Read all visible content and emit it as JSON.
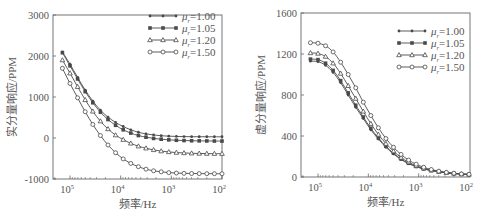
{
  "chart_data": [
    {
      "type": "line",
      "title": "",
      "xlabel": "频率/Hz",
      "ylabel": "实分量响应/PPM",
      "x_scale": "log",
      "x_reversed": true,
      "xlim_log10": [
        5.15,
        2.0
      ],
      "ylim": [
        -1000,
        3000
      ],
      "yticks": [
        -1000,
        0,
        1000,
        2000,
        3000
      ],
      "xtick_labels": [
        {
          "log10": 5,
          "base": "10",
          "exp": "5"
        },
        {
          "log10": 4,
          "base": "10",
          "exp": "4"
        },
        {
          "log10": 3,
          "base": "10",
          "exp": "3"
        },
        {
          "log10": 2,
          "base": "10",
          "exp": "2"
        }
      ],
      "grid": false,
      "legend_position": "upper right",
      "x_log10": [
        5.15,
        5.0,
        4.85,
        4.7,
        4.55,
        4.4,
        4.25,
        4.1,
        3.95,
        3.8,
        3.65,
        3.5,
        3.35,
        3.2,
        3.05,
        2.9,
        2.75,
        2.6,
        2.45,
        2.3,
        2.15,
        2.0
      ],
      "series": [
        {
          "name": "μr=1.00",
          "label_mu": "μ",
          "label_sub": "r",
          "label_val": "=1.00",
          "marker": "dot",
          "values": [
            2100,
            1800,
            1480,
            1170,
            900,
            680,
            510,
            380,
            280,
            200,
            140,
            100,
            75,
            55,
            45,
            38,
            34,
            32,
            31,
            30,
            30,
            30
          ]
        },
        {
          "name": "μr=1.05",
          "label_mu": "μ",
          "label_sub": "r",
          "label_val": "=1.05",
          "marker": "square",
          "values": [
            2080,
            1760,
            1440,
            1130,
            860,
            630,
            450,
            310,
            200,
            120,
            60,
            20,
            -10,
            -30,
            -45,
            -55,
            -62,
            -67,
            -70,
            -72,
            -74,
            -75
          ]
        },
        {
          "name": "μr=1.20",
          "label_mu": "μ",
          "label_sub": "r",
          "label_val": "=1.20",
          "marker": "triangle",
          "values": [
            1900,
            1580,
            1250,
            930,
            650,
            410,
            220,
            70,
            -40,
            -130,
            -200,
            -250,
            -290,
            -320,
            -340,
            -355,
            -365,
            -372,
            -377,
            -380,
            -382,
            -383
          ]
        },
        {
          "name": "μr=1.50",
          "label_mu": "μ",
          "label_sub": "r",
          "label_val": "=1.50",
          "marker": "circle",
          "values": [
            1700,
            1330,
            980,
            640,
            330,
            60,
            -170,
            -360,
            -510,
            -620,
            -700,
            -760,
            -800,
            -825,
            -845,
            -855,
            -862,
            -866,
            -868,
            -870,
            -871,
            -872
          ]
        }
      ]
    },
    {
      "type": "line",
      "title": "",
      "xlabel": "频率/Hz",
      "ylabel": "虚分量响应/PPM",
      "x_scale": "log",
      "x_reversed": true,
      "xlim_log10": [
        5.2,
        2.0
      ],
      "ylim": [
        0,
        1600
      ],
      "yticks": [
        0,
        400,
        800,
        1200,
        1600
      ],
      "xtick_labels": [
        {
          "log10": 5,
          "base": "10",
          "exp": "5"
        },
        {
          "log10": 4,
          "base": "10",
          "exp": "4"
        },
        {
          "log10": 3,
          "base": "10",
          "exp": "3"
        },
        {
          "log10": 2,
          "base": "10",
          "exp": "2"
        }
      ],
      "grid": false,
      "legend_position": "upper right",
      "x_log10": [
        5.15,
        5.0,
        4.85,
        4.7,
        4.55,
        4.4,
        4.25,
        4.1,
        3.95,
        3.8,
        3.65,
        3.5,
        3.35,
        3.2,
        3.05,
        2.9,
        2.75,
        2.6,
        2.45,
        2.3,
        2.15,
        2.0
      ],
      "series": [
        {
          "name": "μr=1.00",
          "label_mu": "μ",
          "label_sub": "r",
          "label_val": "=1.00",
          "marker": "dot",
          "values": [
            1130,
            1125,
            1090,
            1020,
            920,
            800,
            680,
            570,
            460,
            370,
            290,
            225,
            170,
            130,
            100,
            78,
            62,
            50,
            40,
            33,
            28,
            25
          ]
        },
        {
          "name": "μr=1.05",
          "label_mu": "μ",
          "label_sub": "r",
          "label_val": "=1.05",
          "marker": "square",
          "values": [
            1150,
            1145,
            1110,
            1040,
            940,
            820,
            700,
            585,
            475,
            380,
            300,
            232,
            176,
            134,
            103,
            80,
            63,
            51,
            41,
            34,
            28,
            25
          ]
        },
        {
          "name": "μr=1.20",
          "label_mu": "μ",
          "label_sub": "r",
          "label_val": "=1.20",
          "marker": "triangle",
          "values": [
            1210,
            1205,
            1175,
            1110,
            1010,
            890,
            765,
            640,
            520,
            415,
            325,
            252,
            190,
            145,
            110,
            85,
            66,
            53,
            42,
            35,
            29,
            25
          ]
        },
        {
          "name": "μr=1.50",
          "label_mu": "μ",
          "label_sub": "r",
          "label_val": "=1.50",
          "marker": "circle",
          "values": [
            1310,
            1305,
            1280,
            1220,
            1120,
            1000,
            870,
            730,
            600,
            480,
            375,
            290,
            220,
            165,
            125,
            95,
            73,
            57,
            45,
            37,
            30,
            26
          ]
        }
      ]
    }
  ],
  "colors": {
    "line": "#4a4a4a",
    "axis": "#666666",
    "text": "#555555",
    "background": "#ffffff"
  }
}
